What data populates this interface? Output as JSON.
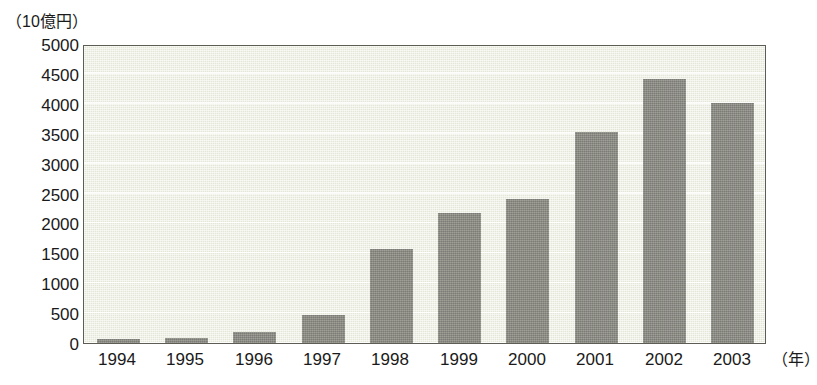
{
  "chart_data": {
    "type": "bar",
    "title": "",
    "subtitle": "",
    "xlabel": "（年）",
    "ylabel": "（10億円）",
    "categories": [
      "1994",
      "1995",
      "1996",
      "1997",
      "1998",
      "1999",
      "2000",
      "2001",
      "2002",
      "2003"
    ],
    "values": [
      60,
      80,
      190,
      470,
      1570,
      2180,
      2410,
      3530,
      4420,
      4010
    ],
    "series": [
      {
        "name": "",
        "values": [
          60,
          80,
          190,
          470,
          1570,
          2180,
          2410,
          3530,
          4420,
          4010
        ]
      }
    ],
    "ylim": [
      0,
      5000
    ],
    "y_ticks": [
      5000,
      4500,
      4000,
      3500,
      3000,
      2500,
      2000,
      1500,
      1000,
      500,
      0
    ],
    "y_tick_labels": [
      "5000",
      "4500",
      "4000",
      "3500",
      "3000",
      "2500",
      "2000",
      "1500",
      "1000",
      "500",
      "0"
    ],
    "grid": true,
    "grid_axis": "y",
    "legend": false,
    "legend_position": "none",
    "bar_color": "#8b8b83",
    "plot_background_color": "#e4e6d7",
    "frame_color": "#5d5d56",
    "text_color": "#1a1a1a",
    "page_background_color": "#ffffff"
  },
  "axes": {
    "y_unit_caption": "（10億円）",
    "x_unit_caption": "（年）"
  }
}
